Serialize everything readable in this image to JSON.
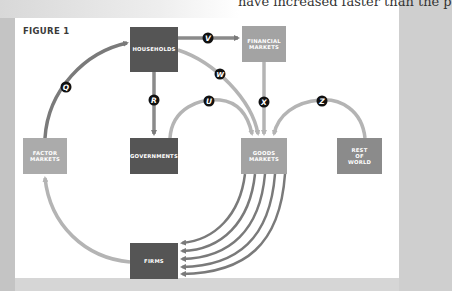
{
  "page": {
    "top_text": "have increased faster than the p"
  },
  "figure": {
    "title": "FIGURE 1",
    "colors": {
      "dark_box": "#555555",
      "light_box": "#a3a3a3",
      "rest_box": "#8b8b8b",
      "dark_arrow": "#7a7a7a",
      "light_arrow": "#b4b4b4",
      "label_circle": "#111111"
    },
    "nodes": [
      {
        "id": "households",
        "label": "HOUSEHOLDS"
      },
      {
        "id": "financial_markets",
        "label": "FINANCIAL\nMARKETS"
      },
      {
        "id": "factor_markets",
        "label": "FACTOR\nMARKETS"
      },
      {
        "id": "governments",
        "label": "GOVERNMENTS"
      },
      {
        "id": "goods_markets",
        "label": "GOODS\nMARKETS"
      },
      {
        "id": "rest_of_world",
        "label": "REST\nOF\nWORLD"
      },
      {
        "id": "firms",
        "label": "FIRMS"
      }
    ],
    "flows": [
      {
        "label": "Q",
        "from": "factor_markets",
        "to": "households"
      },
      {
        "label": "V",
        "from": "households",
        "to": "financial_markets"
      },
      {
        "label": "W",
        "from": "households",
        "to": "goods_markets"
      },
      {
        "label": "R",
        "from": "households",
        "to": "governments"
      },
      {
        "label": "U",
        "from": "governments",
        "to": "goods_markets"
      },
      {
        "label": "X",
        "from": "financial_markets",
        "to": "goods_markets"
      },
      {
        "label": "Z",
        "from": "rest_of_world",
        "to": "goods_markets"
      },
      {
        "label": "",
        "from": "goods_markets",
        "to": "firms",
        "count": 5
      },
      {
        "label": "",
        "from": "firms",
        "to": "factor_markets"
      }
    ]
  }
}
